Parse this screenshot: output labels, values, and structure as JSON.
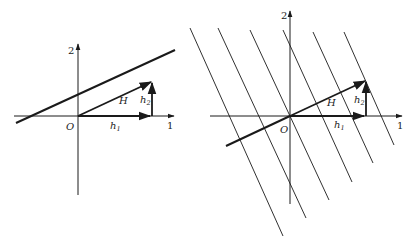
{
  "left_panel": {
    "axis_y_label": "2",
    "axis_x_label": "1",
    "origin_label": "O",
    "vector_H_label": "H",
    "h1_label": "h",
    "h1_sub": "1",
    "h2_label": "h",
    "h2_sub": "2"
  },
  "right_panel": {
    "axis_y_label": "2",
    "axis_x_label": "1",
    "origin_label": "O",
    "vector_H_label": "H",
    "h1_label": "h",
    "h1_sub": "1",
    "h2_label": "h",
    "h2_sub": "2"
  },
  "colors": {
    "stroke": "#1a1a1a",
    "background": "#ffffff"
  }
}
